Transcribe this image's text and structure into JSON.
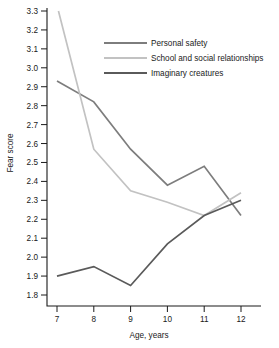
{
  "chart_data": {
    "type": "line",
    "title": "",
    "xlabel": "Age, years",
    "ylabel": "Fear score",
    "x": [
      7,
      8,
      9,
      10,
      11,
      12
    ],
    "xlim": [
      6.55,
      12.45
    ],
    "ylim": [
      1.74,
      3.34
    ],
    "xticks": [
      "7",
      "8",
      "9",
      "10",
      "11",
      "12"
    ],
    "yticks": [
      "1.8",
      "1.9",
      "2.0",
      "2.1",
      "2.2",
      "2.3",
      "2.4",
      "2.5",
      "2.6",
      "2.7",
      "2.8",
      "2.9",
      "3.0",
      "3.1",
      "3.2",
      "3.3"
    ],
    "grid": false,
    "legend_position": "upper-right-inside",
    "series": [
      {
        "name": "Personal safety",
        "color": "#7d7d7d",
        "values": [
          2.93,
          2.82,
          2.57,
          2.38,
          2.48,
          2.22
        ]
      },
      {
        "name": "School and social relationships",
        "color": "#c2c2c2",
        "values": [
          3.33,
          2.57,
          2.35,
          2.29,
          2.22,
          2.34
        ]
      },
      {
        "name": "Imaginary creatures",
        "color": "#5a5a5a",
        "values": [
          1.9,
          1.95,
          1.85,
          2.07,
          2.22,
          2.3
        ]
      }
    ]
  },
  "legend": {
    "items": [
      {
        "label": "Personal safety"
      },
      {
        "label": "School and social relationships"
      },
      {
        "label": "Imaginary creatures"
      }
    ]
  },
  "axes": {
    "x_title": "Age, years",
    "y_title": "Fear score"
  }
}
